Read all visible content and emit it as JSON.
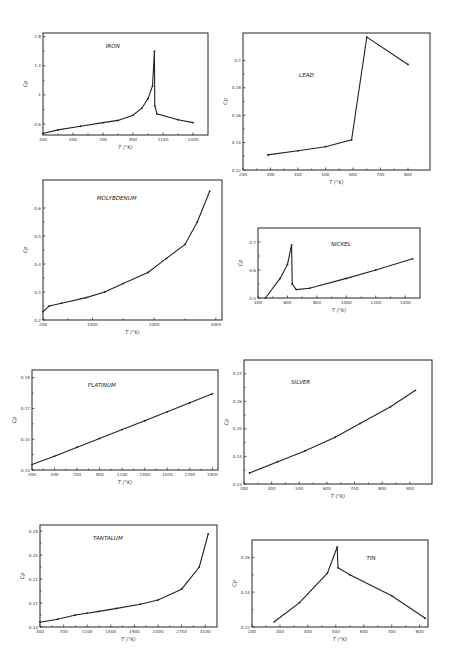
{
  "chart_data": [
    {
      "type": "line",
      "title": "IRON",
      "xlabel": "T (°K)",
      "ylabel": "Cp",
      "xlim": [
        300,
        1400
      ],
      "ylim": [
        0.45,
        1.85
      ],
      "xticks": [
        300,
        500,
        700,
        900,
        1100,
        1300
      ],
      "yticks": [
        0.6,
        1.0,
        1.4,
        1.8
      ],
      "x": [
        300,
        400,
        550,
        700,
        800,
        900,
        960,
        1000,
        1030,
        1043,
        1045,
        1060,
        1200,
        1300
      ],
      "y": [
        0.47,
        0.52,
        0.57,
        0.62,
        0.65,
        0.72,
        0.82,
        0.95,
        1.12,
        1.6,
        0.85,
        0.74,
        0.66,
        0.62
      ],
      "frame": [
        43,
        33,
        208,
        135
      ]
    },
    {
      "type": "line",
      "title": "LEAD",
      "xlabel": "T (°K)",
      "ylabel": "Cp",
      "xlim": [
        200,
        880
      ],
      "ylim": [
        0.12,
        0.22
      ],
      "xticks": [
        200,
        300,
        400,
        500,
        600,
        700,
        800
      ],
      "yticks": [
        0.12,
        0.14,
        0.16,
        0.18,
        0.2
      ],
      "x": [
        290,
        400,
        500,
        595,
        650,
        800
      ],
      "y": [
        0.131,
        0.134,
        0.137,
        0.142,
        0.217,
        0.197
      ],
      "frame": [
        243,
        33,
        430,
        170
      ]
    },
    {
      "type": "line",
      "title": "MOLYBDENUM",
      "xlabel": "T (°K)",
      "ylabel": "Cp",
      "xlim": [
        200,
        3100
      ],
      "ylim": [
        0.2,
        0.7
      ],
      "xticks": [
        200,
        1000,
        2000,
        3000
      ],
      "yticks": [
        0.2,
        0.3,
        0.4,
        0.5,
        0.6
      ],
      "x": [
        200,
        300,
        500,
        900,
        1200,
        1500,
        1900,
        2200,
        2500,
        2700,
        2900
      ],
      "y": [
        0.23,
        0.25,
        0.26,
        0.28,
        0.3,
        0.33,
        0.37,
        0.42,
        0.47,
        0.55,
        0.66
      ],
      "frame": [
        43,
        180,
        222,
        320
      ]
    },
    {
      "type": "line",
      "title": "NICKEL",
      "xlabel": "T (°K)",
      "ylabel": "Cp",
      "xlim": [
        400,
        1500
      ],
      "ylim": [
        0.5,
        0.75
      ],
      "xticks": [
        400,
        600,
        800,
        1000,
        1200,
        1400
      ],
      "yticks": [
        0.5,
        0.6,
        0.7
      ],
      "x": [
        450,
        550,
        600,
        628,
        632,
        660,
        750,
        1000,
        1200,
        1450
      ],
      "y": [
        0.5,
        0.57,
        0.62,
        0.69,
        0.55,
        0.53,
        0.535,
        0.57,
        0.6,
        0.64
      ],
      "frame": [
        258,
        228,
        420,
        298
      ]
    },
    {
      "type": "line",
      "title": "PLATINUM",
      "xlabel": "T (°K)",
      "ylabel": "Cp",
      "xlim": [
        300,
        1950
      ],
      "ylim": [
        0.13,
        0.195
      ],
      "xticks": [
        300,
        500,
        700,
        900,
        1100,
        1300,
        1500,
        1700,
        1900
      ],
      "yticks": [
        0.13,
        0.15,
        0.17,
        0.19
      ],
      "x": [
        300,
        500,
        700,
        900,
        1100,
        1300,
        1500,
        1700,
        1900
      ],
      "y": [
        0.1335,
        0.139,
        0.1448,
        0.1505,
        0.1563,
        0.162,
        0.1678,
        0.1737,
        0.1795
      ],
      "frame": [
        32,
        370,
        218,
        470
      ]
    },
    {
      "type": "line",
      "title": "SILVER",
      "xlabel": "T (°K)",
      "ylabel": "Cp",
      "xlim": [
        300,
        980
      ],
      "ylim": [
        0.23,
        0.275
      ],
      "xticks": [
        300,
        400,
        500,
        600,
        700,
        800,
        900
      ],
      "yticks": [
        0.23,
        0.24,
        0.25,
        0.26,
        0.27
      ],
      "x": [
        320,
        420,
        520,
        630,
        720,
        830,
        920
      ],
      "y": [
        0.234,
        0.238,
        0.242,
        0.247,
        0.252,
        0.258,
        0.264
      ],
      "frame": [
        244,
        360,
        432,
        484
      ]
    },
    {
      "type": "line",
      "title": "TANTALUM",
      "xlabel": "T (°K)",
      "ylabel": "Cp",
      "xlim": [
        300,
        3300
      ],
      "ylim": [
        0.13,
        0.3
      ],
      "xticks": [
        300,
        700,
        1100,
        1500,
        1900,
        2300,
        2700,
        3100
      ],
      "yticks": [
        0.13,
        0.17,
        0.21,
        0.25,
        0.29
      ],
      "x": [
        300,
        600,
        900,
        1100,
        1300,
        1600,
        2000,
        2300,
        2700,
        3000,
        3150
      ],
      "y": [
        0.138,
        0.143,
        0.15,
        0.153,
        0.156,
        0.161,
        0.168,
        0.175,
        0.193,
        0.23,
        0.285
      ],
      "frame": [
        40,
        525,
        217,
        627
      ]
    },
    {
      "type": "line",
      "title": "TIN",
      "xlabel": "T (°K)",
      "ylabel": "Cp",
      "xlim": [
        200,
        830
      ],
      "ylim": [
        0.22,
        0.27
      ],
      "xticks": [
        200,
        300,
        400,
        500,
        600,
        700,
        800
      ],
      "yticks": [
        0.22,
        0.24,
        0.26
      ],
      "x": [
        280,
        370,
        470,
        505,
        508,
        550,
        700,
        820
      ],
      "y": [
        0.223,
        0.234,
        0.251,
        0.266,
        0.254,
        0.25,
        0.238,
        0.225
      ],
      "frame": [
        252,
        540,
        428,
        627
      ]
    }
  ]
}
